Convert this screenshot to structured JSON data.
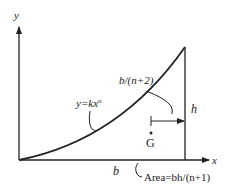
{
  "diagram": {
    "title": "",
    "axes": {
      "x_label": "x",
      "y_label": "y"
    },
    "curve": {
      "equation_label": "y=kx",
      "equation_exponent": "n"
    },
    "dimensions": {
      "base_label": "b",
      "height_label": "h",
      "centroid_offset_label": "b/(n+2)"
    },
    "centroid": {
      "label": "G"
    },
    "area": {
      "label": "Area=bh/(n+1)"
    },
    "colors": {
      "line": "#222222",
      "background": "#ffffff"
    }
  }
}
